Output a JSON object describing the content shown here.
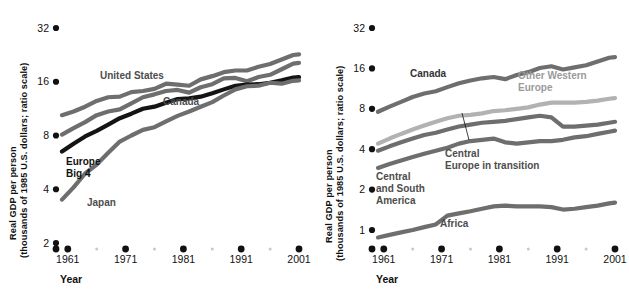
{
  "figure": {
    "panels": [
      {
        "id": "left",
        "axis": {
          "ylabel_line1": "Real GDP per person",
          "ylabel_line2": "(thousands of 1985 U.S. dollars; ratio scale)",
          "xlabel": "Year",
          "yticks": [
            "32",
            "16",
            "8",
            "4",
            "2"
          ],
          "xticks": [
            "1961",
            "1971",
            "1981",
            "1991",
            "2001"
          ]
        },
        "labels": [
          {
            "name": "united-states",
            "text": "United States"
          },
          {
            "name": "canada",
            "text": "Canada"
          },
          {
            "name": "europe-big-4-line1",
            "text": "Europe"
          },
          {
            "name": "europe-big-4-line2",
            "text": "Big 4"
          },
          {
            "name": "japan",
            "text": "Japan"
          }
        ]
      },
      {
        "id": "right",
        "axis": {
          "ylabel_line1": "Real GDP per person",
          "ylabel_line2": "(thousands of 1985 U.S. dollars; ratio scale)",
          "xlabel": "Year",
          "yticks": [
            "32",
            "16",
            "8",
            "4",
            "2",
            "1"
          ],
          "xticks": [
            "1961",
            "1971",
            "1981",
            "1991",
            "2001"
          ]
        },
        "labels": [
          {
            "name": "canada",
            "text": "Canada"
          },
          {
            "name": "other-western-europe-line1",
            "text": "Other Western"
          },
          {
            "name": "other-western-europe-line2",
            "text": "Europe"
          },
          {
            "name": "central-europe-in-transition-line1",
            "text": "Central"
          },
          {
            "name": "central-europe-in-transition-line2",
            "text": "Europe in transition"
          },
          {
            "name": "central-and-south-america-line1",
            "text": "Central"
          },
          {
            "name": "central-and-south-america-line2",
            "text": "and South"
          },
          {
            "name": "central-and-south-america-line3",
            "text": "America"
          },
          {
            "name": "africa",
            "text": "Africa"
          }
        ]
      }
    ]
  },
  "colors": {
    "line_gray": "#6e6e6e",
    "line_dark": "#141414",
    "line_light": "#b2b2b2",
    "tick_dot": "#111111",
    "minor_dot": "#c8c8c8",
    "text": "#111111",
    "label_gray": "#4d4d4d",
    "background": "#ffffff"
  },
  "chart_data": [
    {
      "type": "line",
      "panel": "left",
      "title": "",
      "xlabel": "Year",
      "ylabel": "Real GDP per person (thousands of 1985 U.S. dollars; ratio scale)",
      "yscale": "log2",
      "ylim": [
        2,
        32
      ],
      "yticks": [
        2,
        4,
        8,
        16,
        32
      ],
      "xlim": [
        1960,
        2001
      ],
      "xticks": [
        1961,
        1971,
        1981,
        1991,
        2001
      ],
      "grid": false,
      "legend": "inline-labels",
      "x": [
        1960,
        1962,
        1964,
        1966,
        1968,
        1970,
        1972,
        1974,
        1976,
        1978,
        1980,
        1982,
        1984,
        1986,
        1988,
        1990,
        1992,
        1994,
        1996,
        1998,
        2000,
        2001
      ],
      "series": [
        {
          "name": "United States",
          "color": "#6e6e6e",
          "values": [
            10.4,
            10.9,
            11.6,
            12.5,
            13.1,
            13.2,
            14.0,
            14.2,
            14.6,
            15.6,
            15.4,
            15.2,
            16.5,
            17.2,
            18.1,
            18.5,
            18.5,
            19.4,
            20.1,
            21.3,
            22.6,
            22.8
          ]
        },
        {
          "name": "Canada",
          "color": "#6e6e6e",
          "values": [
            8.1,
            8.8,
            9.5,
            10.4,
            10.9,
            11.2,
            12.1,
            13.1,
            13.6,
            14.2,
            14.4,
            13.9,
            14.9,
            15.5,
            16.7,
            16.8,
            16.1,
            17.0,
            17.5,
            18.8,
            20.2,
            20.4
          ]
        },
        {
          "name": "Europe Big 4",
          "color": "#141414",
          "values": [
            6.5,
            7.2,
            7.9,
            8.5,
            9.2,
            10.0,
            10.6,
            11.3,
            11.6,
            12.2,
            12.8,
            12.9,
            13.2,
            13.8,
            14.5,
            15.2,
            15.4,
            15.5,
            15.8,
            16.3,
            16.9,
            17.0
          ]
        },
        {
          "name": "Japan",
          "color": "#6e6e6e",
          "values": [
            3.5,
            4.1,
            4.9,
            5.5,
            6.4,
            7.4,
            8.0,
            8.6,
            8.9,
            9.6,
            10.3,
            10.9,
            11.6,
            12.3,
            13.4,
            14.5,
            15.1,
            15.2,
            15.8,
            15.6,
            16.2,
            16.3
          ]
        }
      ]
    },
    {
      "type": "line",
      "panel": "right",
      "title": "",
      "xlabel": "Year",
      "ylabel": "Real GDP per person (thousands of 1985 U.S. dollars; ratio scale)",
      "yscale": "log2",
      "ylim": [
        0.8,
        32
      ],
      "yticks": [
        1,
        2,
        4,
        8,
        16,
        32
      ],
      "xlim": [
        1960,
        2001
      ],
      "xticks": [
        1961,
        1971,
        1981,
        1991,
        2001
      ],
      "grid": false,
      "legend": "inline-labels",
      "x": [
        1960,
        1962,
        1964,
        1966,
        1968,
        1970,
        1972,
        1974,
        1976,
        1978,
        1980,
        1982,
        1984,
        1986,
        1988,
        1990,
        1992,
        1994,
        1996,
        1998,
        2000,
        2001
      ],
      "series": [
        {
          "name": "Canada",
          "color": "#6e6e6e",
          "values": [
            7.6,
            8.3,
            9.0,
            9.8,
            10.4,
            10.8,
            11.6,
            12.4,
            13.0,
            13.5,
            13.8,
            13.3,
            14.3,
            15.0,
            16.1,
            16.6,
            15.7,
            16.3,
            16.9,
            18.0,
            19.2,
            19.4
          ]
        },
        {
          "name": "Other Western Europe",
          "color": "#b2b2b2",
          "values": [
            4.4,
            4.8,
            5.2,
            5.6,
            6.0,
            6.4,
            6.8,
            7.1,
            7.2,
            7.4,
            7.7,
            7.8,
            8.0,
            8.2,
            8.6,
            8.9,
            8.9,
            8.9,
            9.0,
            9.2,
            9.5,
            9.6
          ]
        },
        {
          "name": "Central Europe in transition",
          "color": "#6e6e6e",
          "values": [
            3.9,
            4.2,
            4.5,
            4.8,
            5.1,
            5.3,
            5.6,
            5.9,
            6.1,
            6.3,
            6.4,
            6.5,
            6.7,
            6.9,
            7.1,
            6.9,
            5.9,
            5.9,
            6.0,
            6.1,
            6.3,
            6.4
          ]
        },
        {
          "name": "Central and South America",
          "color": "#6e6e6e",
          "values": [
            2.9,
            3.1,
            3.3,
            3.5,
            3.7,
            3.9,
            4.1,
            4.4,
            4.6,
            4.7,
            4.8,
            4.5,
            4.4,
            4.5,
            4.6,
            4.6,
            4.7,
            4.9,
            5.0,
            5.2,
            5.4,
            5.5
          ]
        },
        {
          "name": "Africa",
          "color": "#6e6e6e",
          "values": [
            0.88,
            0.92,
            0.96,
            1.0,
            1.05,
            1.1,
            1.28,
            1.33,
            1.38,
            1.44,
            1.5,
            1.52,
            1.5,
            1.5,
            1.5,
            1.48,
            1.42,
            1.44,
            1.48,
            1.52,
            1.58,
            1.6
          ]
        }
      ]
    }
  ]
}
